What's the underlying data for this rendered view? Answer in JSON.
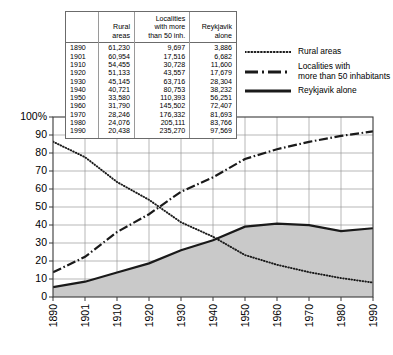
{
  "chart_data": {
    "type": "line",
    "title": "",
    "xlabel": "",
    "ylabel": "",
    "x": [
      1890,
      1901,
      1910,
      1920,
      1930,
      1940,
      1950,
      1960,
      1970,
      1980,
      1990
    ],
    "xlim": [
      1890,
      1990
    ],
    "ylim": [
      0,
      100
    ],
    "yticks": [
      0,
      10,
      20,
      30,
      40,
      50,
      60,
      70,
      80,
      90,
      100
    ],
    "ytick_labels": [
      "0",
      "10",
      "20",
      "30",
      "40",
      "50",
      "60",
      "70",
      "80",
      "90",
      "100%"
    ],
    "xtick_labels": [
      "1890",
      "1901",
      "1910",
      "1920",
      "1930",
      "1940",
      "1950",
      "1960",
      "1970",
      "1980",
      "1990"
    ],
    "grid": true,
    "legend_position": "top-right",
    "series": [
      {
        "name": "Rural areas",
        "style": "dotted",
        "color": "#1a1a1a",
        "values": [
          86.3,
          77.7,
          63.9,
          54.0,
          41.5,
          33.5,
          23.3,
          17.9,
          13.8,
          10.5,
          8.0
        ]
      },
      {
        "name": "Localities with more than 50 inhabitants",
        "style": "dash-dot",
        "color": "#1a1a1a",
        "values": [
          13.7,
          22.3,
          36.1,
          46.0,
          58.5,
          66.5,
          76.7,
          82.1,
          86.2,
          89.5,
          92.0
        ]
      },
      {
        "name": "Reykjavik alone",
        "style": "solid",
        "color": "#1a1a1a",
        "fill": "#c9c9c9",
        "values": [
          5.5,
          8.5,
          13.6,
          18.7,
          26.0,
          31.5,
          39.1,
          40.8,
          39.9,
          36.6,
          38.2
        ]
      }
    ]
  },
  "table": {
    "headers": {
      "year": "",
      "rural": "Rural\nareas",
      "rural_l1": "Rural",
      "rural_l2": "areas",
      "localities_l1": "Localities",
      "localities_l2": "with more",
      "localities_l3": "than 50 inh.",
      "reykjavik_l1": "Reykjavik",
      "reykjavik_l2": "alone"
    },
    "rows": [
      {
        "year": "1890",
        "rural": "61,230",
        "localities": "9,697",
        "reykjavik": "3,886"
      },
      {
        "year": "1901",
        "rural": "60,954",
        "localities": "17,516",
        "reykjavik": "6,682"
      },
      {
        "year": "1910",
        "rural": "54,455",
        "localities": "30,728",
        "reykjavik": "11,600"
      },
      {
        "year": "1920",
        "rural": "51,133",
        "localities": "43,557",
        "reykjavik": "17,679"
      },
      {
        "year": "1930",
        "rural": "45,145",
        "localities": "63,716",
        "reykjavik": "28,304"
      },
      {
        "year": "1940",
        "rural": "40,721",
        "localities": "80,753",
        "reykjavik": "38,232"
      },
      {
        "year": "1950",
        "rural": "33,580",
        "localities": "110,393",
        "reykjavik": "56,251"
      },
      {
        "year": "1960",
        "rural": "31,790",
        "localities": "145,502",
        "reykjavik": "72,407"
      },
      {
        "year": "1970",
        "rural": "28,246",
        "localities": "176,332",
        "reykjavik": "81,693"
      },
      {
        "year": "1980",
        "rural": "24,076",
        "localities": "205,111",
        "reykjavik": "83,766"
      },
      {
        "year": "1990",
        "rural": "20,438",
        "localities": "235,270",
        "reykjavik": "97,569"
      }
    ]
  },
  "legend": {
    "items": [
      {
        "label": "Rural areas",
        "label_line2": "",
        "style": "dotted"
      },
      {
        "label": "Localities with",
        "label_line2": "more than 50 inhabitants",
        "style": "dash-dot"
      },
      {
        "label": "Reykjavik alone",
        "label_line2": "",
        "style": "solid"
      }
    ]
  },
  "colors": {
    "line": "#1a1a1a",
    "area_fill": "#c9c9c9",
    "grid": "#9a9a9a",
    "axis": "#3a3a3a",
    "plot_bg": "#ffffff"
  }
}
